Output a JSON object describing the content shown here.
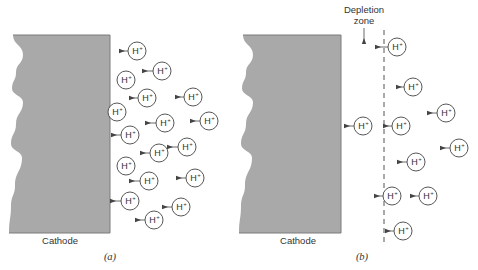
{
  "figure": {
    "colors": {
      "cathode_fill": "#a9a9a9",
      "cathode_edge": "#7a7a7a",
      "line": "#444444",
      "text": "#333333",
      "background": "#ffffff"
    },
    "ion": {
      "symbol": "H",
      "charge": "+",
      "radius": 9
    },
    "panels": [
      {
        "id": "a",
        "panel_label": "(a)",
        "cathode_label": "Cathode",
        "cathode": {
          "left": 14,
          "right": 110,
          "top": 35,
          "bottom": 233
        },
        "cathode_label_pos": [
          60,
          244
        ],
        "panel_label_pos": [
          110,
          260
        ],
        "ions": [
          {
            "x": 137,
            "y": 51,
            "arrow_from": 120
          },
          {
            "x": 162,
            "y": 71,
            "arrow_from": 143
          },
          {
            "x": 126,
            "y": 80,
            "arrow_from": null
          },
          {
            "x": 147,
            "y": 98,
            "arrow_from": 130
          },
          {
            "x": 193,
            "y": 97,
            "arrow_from": 176
          },
          {
            "x": 117,
            "y": 112,
            "arrow_from": null
          },
          {
            "x": 165,
            "y": 123,
            "arrow_from": 146
          },
          {
            "x": 209,
            "y": 121,
            "arrow_from": 191
          },
          {
            "x": 130,
            "y": 135,
            "arrow_from": 112
          },
          {
            "x": 159,
            "y": 153,
            "arrow_from": 141
          },
          {
            "x": 187,
            "y": 147,
            "arrow_from": 168
          },
          {
            "x": 126,
            "y": 166,
            "arrow_from": null
          },
          {
            "x": 149,
            "y": 181,
            "arrow_from": 130
          },
          {
            "x": 195,
            "y": 178,
            "arrow_from": 177
          },
          {
            "x": 130,
            "y": 201,
            "arrow_from": 111
          },
          {
            "x": 181,
            "y": 207,
            "arrow_from": 163
          },
          {
            "x": 154,
            "y": 220,
            "arrow_from": 136
          }
        ]
      },
      {
        "id": "b",
        "panel_label": "(b)",
        "cathode_label": "Cathode",
        "cathode": {
          "left": 244,
          "right": 341,
          "top": 35,
          "bottom": 233
        },
        "cathode_label_pos": [
          298,
          244
        ],
        "panel_label_pos": [
          362,
          260
        ],
        "depletion_zone": {
          "label_line1": "Depletion",
          "label_line2": "zone",
          "label_x": 364,
          "label_y1": 13,
          "label_y2": 24,
          "arrow_x": 364,
          "arrow_y1": 28,
          "arrow_y2": 43,
          "boundary_x": 384,
          "boundary_y1": 30,
          "boundary_y2": 243
        },
        "ions": [
          {
            "x": 397,
            "y": 47,
            "arrow_from": 376
          },
          {
            "x": 413,
            "y": 87,
            "arrow_from": 397
          },
          {
            "x": 446,
            "y": 113,
            "arrow_from": 428
          },
          {
            "x": 363,
            "y": 126,
            "arrow_from": 345
          },
          {
            "x": 401,
            "y": 126,
            "arrow_from": 384
          },
          {
            "x": 459,
            "y": 148,
            "arrow_from": 441
          },
          {
            "x": 416,
            "y": 162,
            "arrow_from": 398
          },
          {
            "x": 392,
            "y": 196,
            "arrow_from": 375
          },
          {
            "x": 428,
            "y": 196,
            "arrow_from": 411
          },
          {
            "x": 403,
            "y": 231,
            "arrow_from": 386
          }
        ]
      }
    ]
  }
}
